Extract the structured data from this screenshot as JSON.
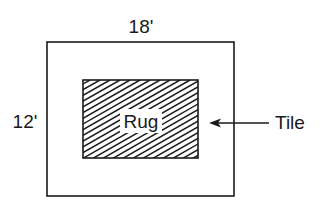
{
  "diagram": {
    "type": "floor-plan",
    "colors": {
      "stroke": "#1a1a1a",
      "background": "#ffffff"
    },
    "outer_room": {
      "label": "Tile",
      "width_label": "18'",
      "height_label": "12'"
    },
    "inner_rug": {
      "label": "Rug",
      "fill": "diagonal-hatch"
    },
    "arrow": {
      "icon": "left-arrow-icon",
      "points_to": "Tile area"
    }
  }
}
